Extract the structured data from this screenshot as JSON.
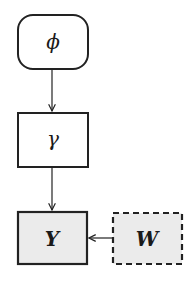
{
  "diagram": {
    "nodes": [
      {
        "id": "phi",
        "label": "ϕ",
        "shape": "rounded-rect",
        "fill": "#ffffff",
        "border": "solid"
      },
      {
        "id": "gamma",
        "label": "γ",
        "shape": "rect",
        "fill": "#ffffff",
        "border": "solid"
      },
      {
        "id": "Y",
        "label": "Y",
        "shape": "rect",
        "fill": "#ebebeb",
        "border": "solid",
        "bold": true
      },
      {
        "id": "W",
        "label": "W",
        "shape": "rect",
        "fill": "#ebebeb",
        "border": "dashed",
        "bold": true
      }
    ],
    "edges": [
      {
        "from": "phi",
        "to": "gamma"
      },
      {
        "from": "gamma",
        "to": "Y"
      },
      {
        "from": "W",
        "to": "Y"
      }
    ],
    "colors": {
      "stroke": "#222222",
      "observed_fill": "#ebebeb"
    }
  }
}
